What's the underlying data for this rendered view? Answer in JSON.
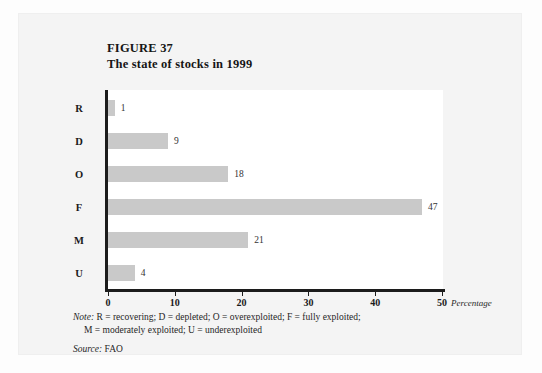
{
  "figure": {
    "label": "FIGURE 37",
    "subtitle": "The state of stocks in 1999"
  },
  "chart_data": {
    "type": "bar",
    "orientation": "horizontal",
    "title": "The state of stocks in 1999",
    "figure_number": "FIGURE 37",
    "categories": [
      "R",
      "D",
      "O",
      "F",
      "M",
      "U"
    ],
    "values": [
      1,
      9,
      18,
      47,
      21,
      4
    ],
    "value_labels": [
      "1",
      "9",
      "18",
      "47",
      "21",
      "4"
    ],
    "xlabel": "Percentage",
    "ylabel": "",
    "xlim": [
      0,
      50
    ],
    "xticks": [
      0,
      10,
      20,
      30,
      40,
      50
    ],
    "xtick_labels": [
      "0",
      "10",
      "20",
      "30",
      "40",
      "50"
    ],
    "grid": false,
    "legend": false,
    "bar_color": "#c9c9c9",
    "axis_color": "#1c1c1c",
    "plot_background": "#ffffff",
    "page_background": "#f4f4f4",
    "category_definitions": {
      "R": "recovering",
      "D": "depleted",
      "O": "overexploited",
      "F": "fully exploited",
      "M": "moderately exploited",
      "U": "underexploited"
    }
  },
  "footnotes": {
    "note_lead": "Note:",
    "note_line_1": " R = recovering; D = depleted; O = overexploited; F = fully exploited;",
    "note_line_2": "M = moderately exploited; U = underexploited",
    "source_lead": "Source:",
    "source_value": " FAO"
  }
}
